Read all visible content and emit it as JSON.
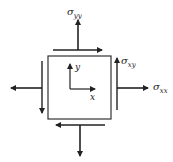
{
  "diagram": {
    "type": "stress-element",
    "labels": {
      "sigma_yy": {
        "base": "σ",
        "sub": "yy"
      },
      "sigma_xy": {
        "base": "σ",
        "sub": "xy"
      },
      "sigma_xx": {
        "base": "σ",
        "sub": "xx"
      },
      "axis_x": "x",
      "axis_y": "y"
    },
    "colors": {
      "stroke": "#222222",
      "background": "#ffffff"
    }
  }
}
